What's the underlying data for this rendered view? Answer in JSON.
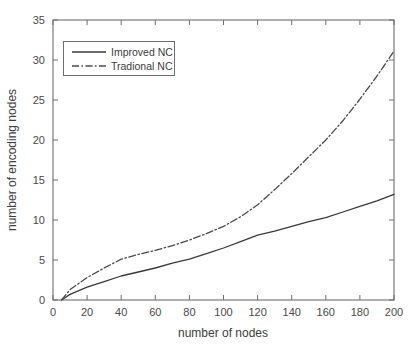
{
  "chart_data": {
    "type": "line",
    "title": "",
    "xlabel": "number of nodes",
    "ylabel": "number of encoding nodes",
    "xlim": [
      0,
      200
    ],
    "ylim": [
      0,
      35
    ],
    "xticks": [
      "0",
      "20",
      "40",
      "60",
      "80",
      "100",
      "120",
      "140",
      "160",
      "180",
      "200"
    ],
    "yticks": [
      "0",
      "5",
      "10",
      "15",
      "20",
      "25",
      "30",
      "35"
    ],
    "grid": false,
    "legend_position": "upper-left",
    "x": [
      5,
      10,
      20,
      30,
      40,
      50,
      60,
      70,
      80,
      90,
      100,
      110,
      120,
      130,
      140,
      150,
      160,
      170,
      180,
      190,
      200
    ],
    "series": [
      {
        "name": "Improved NC",
        "style": "solid",
        "color": "#3a3a3a",
        "values": [
          0,
          0.7,
          1.6,
          2.3,
          3.0,
          3.5,
          4.0,
          4.6,
          5.1,
          5.8,
          6.5,
          7.3,
          8.1,
          8.6,
          9.2,
          9.8,
          10.3,
          11.0,
          11.7,
          12.4,
          13.2
        ]
      },
      {
        "name": "Tradional NC",
        "style": "dash-dot",
        "color": "#4a4a4a",
        "values": [
          0,
          1.3,
          2.8,
          4.0,
          5.1,
          5.7,
          6.2,
          6.8,
          7.5,
          8.3,
          9.2,
          10.4,
          11.9,
          13.8,
          15.8,
          17.9,
          20.0,
          22.4,
          25.1,
          28.0,
          31.1
        ]
      }
    ]
  },
  "legend": {
    "items": [
      {
        "label": "Improved NC"
      },
      {
        "label": "Tradional NC"
      }
    ]
  }
}
